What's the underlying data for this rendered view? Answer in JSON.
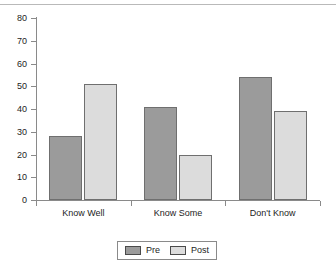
{
  "chart_data": {
    "type": "bar",
    "title": "",
    "xlabel": "",
    "ylabel": "",
    "ylim": [
      0,
      80
    ],
    "ytick_step": 10,
    "yticks": [
      "80",
      "70",
      "60",
      "50",
      "40",
      "30",
      "20",
      "10",
      "0"
    ],
    "categories": [
      "Know Well",
      "Know Some",
      "Don't Know"
    ],
    "grid": false,
    "legend_position": "bottom-center",
    "series": [
      {
        "name": "Pre",
        "color": "#9b9b9b",
        "values": [
          28,
          41,
          54
        ]
      },
      {
        "name": "Post",
        "color": "#dcdcdc",
        "values": [
          51,
          20,
          39
        ]
      }
    ]
  },
  "legend": {
    "entries": [
      {
        "label": "Pre"
      },
      {
        "label": "Post"
      }
    ]
  },
  "artifacts": {
    "top_rule_text": ""
  }
}
